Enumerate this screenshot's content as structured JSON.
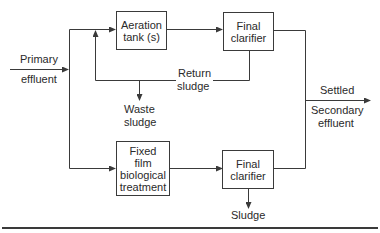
{
  "diagram": {
    "nodes": {
      "aeration": {
        "label": "Aeration tank (s)",
        "line1": "Aeration",
        "line2": "tank (s)"
      },
      "clarifier_top": {
        "label": "Final clarifier",
        "line1": "Final",
        "line2": "clarifier"
      },
      "fixed_film": {
        "label": "Fixed film biological treatment",
        "line1": "Fixed",
        "line2": "film",
        "line3": "biological",
        "line4": "treatment"
      },
      "clarifier_bottom": {
        "label": "Final clarifier",
        "line1": "Final",
        "line2": "clarifier"
      }
    },
    "labels": {
      "primary_1": "Primary",
      "primary_2": "effluent",
      "return_1": "Return",
      "return_2": "sludge",
      "waste_1": "Waste",
      "waste_2": "sludge",
      "settled": "Settled",
      "secondary_1": "Secondary",
      "secondary_2": "effluent",
      "sludge": "Sludge"
    },
    "edges": [
      {
        "from": "Primary effluent",
        "to": "split"
      },
      {
        "from": "split",
        "to": "Aeration tank (s)"
      },
      {
        "from": "split",
        "to": "Fixed film biological treatment"
      },
      {
        "from": "Aeration tank (s)",
        "to": "Final clarifier (top)"
      },
      {
        "from": "Final clarifier (top)",
        "to": "Aeration tank (s)",
        "label": "Return sludge"
      },
      {
        "from": "Return sludge line",
        "to": "Waste sludge"
      },
      {
        "from": "Fixed film biological treatment",
        "to": "Final clarifier (bottom)"
      },
      {
        "from": "Final clarifier (bottom)",
        "to": "Sludge"
      },
      {
        "from": "Final clarifier (top)",
        "to": "Settled Secondary effluent"
      },
      {
        "from": "Final clarifier (bottom)",
        "to": "Settled Secondary effluent"
      }
    ],
    "colors": {
      "line": "#3a3a3a",
      "background": "#ffffff"
    }
  }
}
